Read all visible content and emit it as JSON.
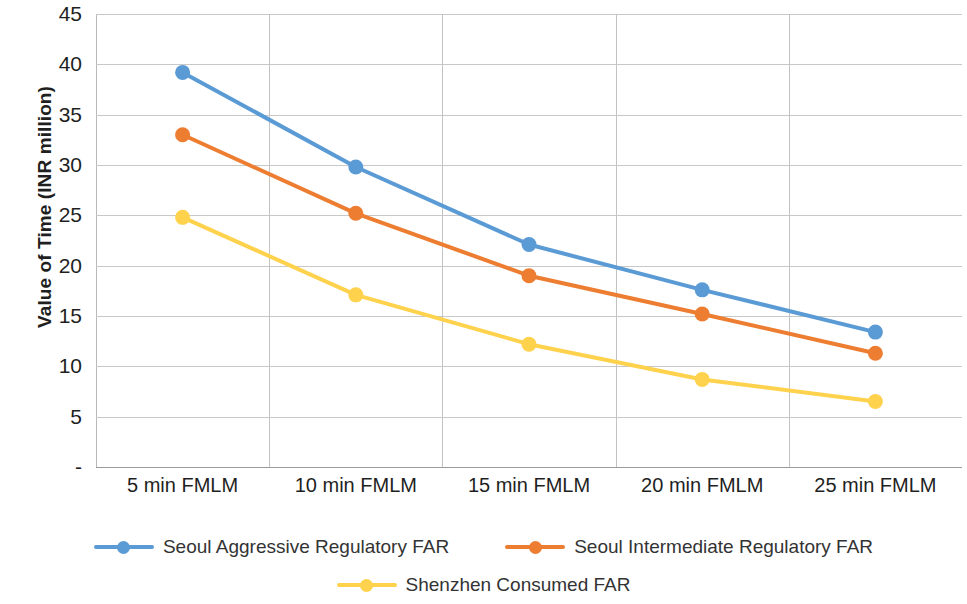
{
  "chart_data": {
    "type": "line",
    "title": "",
    "xlabel": "",
    "ylabel": "Value of Time (INR million)",
    "categories": [
      "5 min FMLM",
      "10 min FMLM",
      "15 min FMLM",
      "20 min FMLM",
      "25 min FMLM"
    ],
    "series": [
      {
        "name": "Seoul Aggressive Regulatory FAR",
        "color": "#5B9BD5",
        "values": [
          39.2,
          29.8,
          22.1,
          17.6,
          13.4
        ]
      },
      {
        "name": "Seoul Intermediate Regulatory FAR",
        "color": "#ED7D31",
        "values": [
          33.0,
          25.2,
          19.0,
          15.2,
          11.3
        ]
      },
      {
        "name": "Shenzhen Consumed FAR",
        "color": "#FFD24D",
        "values": [
          24.8,
          17.1,
          12.2,
          8.7,
          6.5
        ]
      }
    ],
    "ylim": [
      0,
      45
    ],
    "ytick_labels": [
      "45",
      "40",
      "35",
      "30",
      "25",
      "20",
      "15",
      "10",
      "5",
      "-"
    ],
    "ytick_values": [
      45,
      40,
      35,
      30,
      25,
      20,
      15,
      10,
      5,
      0
    ],
    "grid": {
      "horizontal": true,
      "vertical": true
    },
    "legend": {
      "position": "bottom",
      "entries": [
        "Seoul Aggressive Regulatory FAR",
        "Seoul Intermediate Regulatory FAR",
        "Shenzhen Consumed FAR"
      ]
    }
  }
}
